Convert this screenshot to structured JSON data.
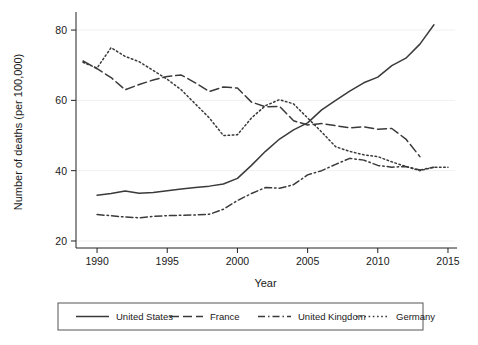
{
  "chart_data": {
    "type": "line",
    "title": "",
    "xlabel": "Year",
    "ylabel": "Number of deaths (per 100,000)",
    "xlim": [
      1988.5,
      2015.5
    ],
    "ylim": [
      18,
      84
    ],
    "xticks": [
      1990,
      1995,
      2000,
      2005,
      2010,
      2015
    ],
    "yticks": [
      20,
      40,
      60,
      80
    ],
    "grid": true,
    "grid_axis": "y",
    "legend_position": "bottom-outside",
    "series": [
      {
        "name": "United States",
        "dash": "solid",
        "x": [
          1990,
          1991,
          1992,
          1993,
          1994,
          1995,
          1996,
          1997,
          1998,
          1999,
          2000,
          2001,
          2002,
          2003,
          2004,
          2005,
          2006,
          2007,
          2008,
          2009,
          2010,
          2011,
          2012,
          2013,
          2014
        ],
        "y": [
          33.0,
          33.5,
          34.2,
          33.6,
          33.8,
          34.3,
          34.8,
          35.2,
          35.6,
          36.2,
          37.8,
          41.5,
          45.5,
          49.0,
          51.6,
          53.6,
          57.3,
          60.0,
          62.6,
          65.0,
          66.6,
          69.9,
          72.0,
          76.0,
          81.5
        ]
      },
      {
        "name": "France",
        "dash": "long-dash",
        "x": [
          1989,
          1990,
          1991,
          1992,
          1993,
          1994,
          1995,
          1996,
          1997,
          1998,
          1999,
          2000,
          2001,
          2002,
          2003,
          2004,
          2005,
          2006,
          2007,
          2008,
          2009,
          2010,
          2011,
          2012,
          2013
        ],
        "y": [
          71.2,
          69.0,
          66.5,
          63.0,
          64.5,
          65.8,
          66.8,
          67.2,
          65.0,
          62.5,
          63.8,
          63.5,
          59.5,
          58.2,
          58.3,
          54.2,
          53.0,
          53.4,
          52.8,
          52.2,
          52.5,
          51.8,
          52.0,
          49.0,
          44.0
        ]
      },
      {
        "name": "United Kingdom",
        "dash": "dash-dot",
        "x": [
          1990,
          1991,
          1992,
          1993,
          1994,
          1995,
          1996,
          1997,
          1998,
          1999,
          2000,
          2001,
          2002,
          2003,
          2004,
          2005,
          2006,
          2007,
          2008,
          2009,
          2010,
          2011,
          2012,
          2013,
          2014
        ],
        "y": [
          27.5,
          27.2,
          26.8,
          26.6,
          27.0,
          27.2,
          27.3,
          27.4,
          27.6,
          29.0,
          31.5,
          33.5,
          35.2,
          35.0,
          36.0,
          38.8,
          40.0,
          41.8,
          43.5,
          43.0,
          41.5,
          41.0,
          41.2,
          40.2,
          41.0
        ]
      },
      {
        "name": "Germany",
        "dash": "dotted",
        "x": [
          1989,
          1990,
          1991,
          1992,
          1993,
          1994,
          1995,
          1996,
          1997,
          1998,
          1999,
          2000,
          2001,
          2002,
          2003,
          2004,
          2005,
          2006,
          2007,
          2008,
          2009,
          2010,
          2011,
          2012,
          2013,
          2014,
          2015
        ],
        "y": [
          70.8,
          69.2,
          75.0,
          72.5,
          71.0,
          68.5,
          66.0,
          63.0,
          59.0,
          55.0,
          50.0,
          50.2,
          55.0,
          58.5,
          60.2,
          59.0,
          55.0,
          51.0,
          46.8,
          45.5,
          44.5,
          44.0,
          42.5,
          41.2,
          40.0,
          41.0,
          41.0
        ]
      }
    ]
  },
  "legend": {
    "entries": [
      {
        "label": "United States"
      },
      {
        "label": "France"
      },
      {
        "label": "United Kingdom"
      },
      {
        "label": "Germany"
      }
    ]
  }
}
